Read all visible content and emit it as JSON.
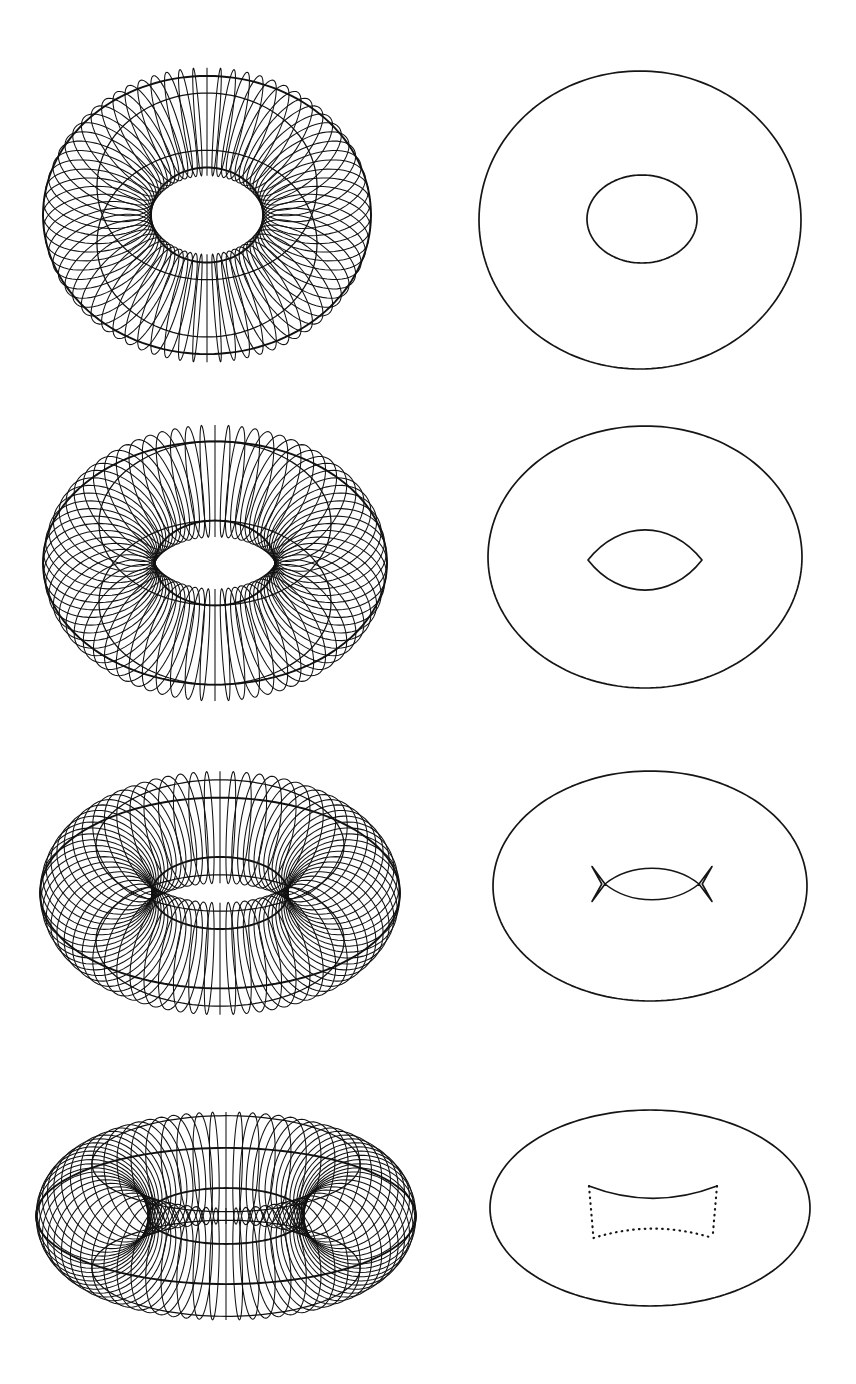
{
  "figure": {
    "canvas": {
      "width": 856,
      "height": 1384,
      "background": "#ffffff",
      "ink": "#111111"
    },
    "columns": [
      {
        "name": "wireframe",
        "label": "torus wireframe"
      },
      {
        "name": "silhouette",
        "label": "apparent contour"
      }
    ],
    "rows": [
      {
        "index": 1,
        "label": "row-1-high-tilt",
        "wireframe": {
          "center_x": 207,
          "center_y": 215,
          "R": 110,
          "r": 54,
          "tilt_deg": 58,
          "meridians": 72,
          "parallels": 4,
          "stroke_width": 1.05,
          "bbox": [
            55,
            60,
            360,
            370
          ]
        },
        "silhouette": {
          "outer": {
            "cx": 640,
            "cy": 220,
            "rx": 161,
            "ry": 149,
            "style": "solid"
          },
          "inner": {
            "cx": 642,
            "cy": 219,
            "rx": 55,
            "ry": 44,
            "style": "solid",
            "shape": "ellipse"
          },
          "inner_cusps": 0
        }
      },
      {
        "index": 2,
        "label": "row-2-medium-tilt",
        "wireframe": {
          "center_x": 215,
          "center_y": 563,
          "R": 116,
          "r": 56,
          "tilt_deg": 45,
          "meridians": 72,
          "parallels": 4,
          "stroke_width": 1.05,
          "bbox": [
            55,
            430,
            380,
            700
          ]
        },
        "silhouette": {
          "outer": {
            "cx": 645,
            "cy": 557,
            "rx": 157,
            "ry": 131,
            "style": "solid"
          },
          "inner": {
            "cx": 645,
            "cy": 560,
            "rx": 57,
            "ry": 30,
            "style": "solid",
            "shape": "lens"
          },
          "inner_cusps": 2
        }
      },
      {
        "index": 3,
        "label": "row-3-low-tilt",
        "wireframe": {
          "center_x": 220,
          "center_y": 893,
          "R": 124,
          "r": 56,
          "tilt_deg": 32,
          "meridians": 72,
          "parallels": 4,
          "stroke_width": 1.05,
          "bbox": [
            55,
            785,
            390,
            1005
          ]
        },
        "silhouette": {
          "outer": {
            "cx": 650,
            "cy": 886,
            "rx": 157,
            "ry": 115,
            "style": "solid"
          },
          "inner": {
            "cx": 652,
            "cy": 884,
            "rx": 47,
            "ry": 14,
            "style": "solid",
            "shape": "lens-with-swallowtails"
          },
          "inner_cusps": 4
        }
      },
      {
        "index": 4,
        "label": "row-4-lowest-tilt",
        "wireframe": {
          "center_x": 226,
          "center_y": 1216,
          "R": 134,
          "r": 56,
          "tilt_deg": 21,
          "meridians": 72,
          "parallels": 4,
          "stroke_width": 1.05,
          "bbox": [
            55,
            1115,
            400,
            1320
          ]
        },
        "silhouette": {
          "outer": {
            "cx": 650,
            "cy": 1208,
            "rx": 160,
            "ry": 98,
            "style": "solid"
          },
          "inner": {
            "cx": 653,
            "cy": 1212,
            "rx": 64,
            "ry": 26,
            "style": "mixed-solid-dotted",
            "shape": "curved-rectangle"
          },
          "inner_cusps": 4,
          "hidden_line_style": "dotted"
        }
      }
    ]
  }
}
